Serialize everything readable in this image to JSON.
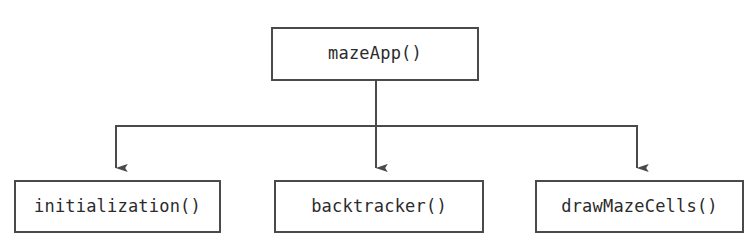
{
  "diagram": {
    "type": "call-hierarchy-flowchart",
    "orientation": "top-down",
    "background_color": "#ffffff",
    "line_color": "#4a4a4a",
    "text_color": "#2b2b2b",
    "root": {
      "label": "mazeApp()"
    },
    "children": [
      {
        "label": "initialization()"
      },
      {
        "label": "backtracker()"
      },
      {
        "label": "drawMazeCells()"
      }
    ],
    "connectors": {
      "stem_label": "root-stem",
      "bus_label": "horizontal-bus",
      "arrow_labels": [
        "arrow-to-initialization",
        "arrow-to-backtracker",
        "arrow-to-drawMazeCells"
      ]
    }
  }
}
